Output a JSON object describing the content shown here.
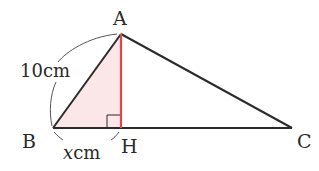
{
  "diagram": {
    "type": "geometry-triangle",
    "points": {
      "A": {
        "label": "A",
        "x": 121,
        "y": 34
      },
      "B": {
        "label": "B",
        "x": 53,
        "y": 128
      },
      "H": {
        "label": "H",
        "x": 121,
        "y": 128
      },
      "C": {
        "label": "C",
        "x": 292,
        "y": 128
      }
    },
    "labels": {
      "A": "A",
      "B": "B",
      "H": "H",
      "C": "C",
      "AB_length": "10cm",
      "BH_length_var": "x",
      "BH_length_unit": "cm"
    },
    "colors": {
      "stroke": "#2b2b2b",
      "altitude": "#e0474c",
      "shade": "#fbe6e8",
      "arc": "#555555"
    }
  }
}
